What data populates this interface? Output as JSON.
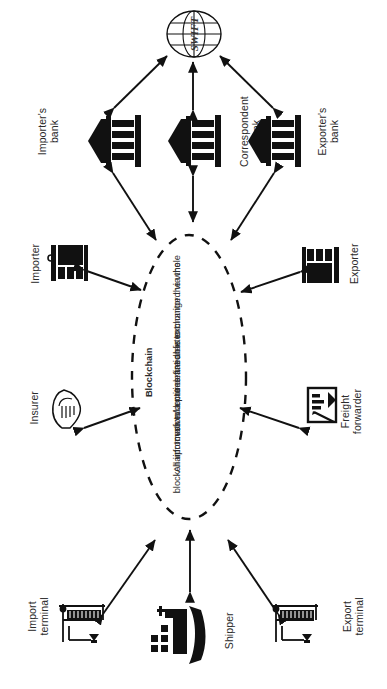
{
  "diagram": {
    "orientation": "rotated-90",
    "colors": {
      "ink": "#111111",
      "text": "#2b2b2b",
      "background": "#ffffff"
    }
  },
  "network": {
    "label": "SWIFT",
    "icon": "globe-icon"
  },
  "banks": [
    {
      "id": "importers-bank",
      "label_line1": "Importer's",
      "label_line2": "bank",
      "icon": "bank-icon"
    },
    {
      "id": "correspondent-bank",
      "label_line1": "Correspondent",
      "label_line2": "bank",
      "icon": "bank-icon"
    },
    {
      "id": "exporters-bank",
      "label_line1": "Exporter's",
      "label_line2": "bank",
      "icon": "bank-icon"
    }
  ],
  "blockchain": {
    "title": "Blockchain",
    "description_line1": "All information/documentation is exchanged via the",
    "description_line2": "blockchain. Involved entities are able to monitor the whole",
    "description_line3": "process to a pre-defined extent."
  },
  "entities": [
    {
      "id": "importer",
      "label_line1": "Importer",
      "label_line2": "",
      "icon": "factory-icon",
      "side": "left"
    },
    {
      "id": "insurer",
      "label_line1": "Insurer",
      "label_line2": "",
      "icon": "handshake-icon",
      "side": "left"
    },
    {
      "id": "exporter",
      "label_line1": "Exporter",
      "label_line2": "",
      "icon": "factory-icon",
      "side": "right"
    },
    {
      "id": "freight-forwarder",
      "label_line1": "Freight",
      "label_line2": "forwarder",
      "icon": "clipboard-chart-icon",
      "side": "right"
    },
    {
      "id": "import-terminal",
      "label_line1": "Import",
      "label_line2": "terminal",
      "icon": "port-crane-icon",
      "side": "bottom"
    },
    {
      "id": "shipper",
      "label_line1": "Shipper",
      "label_line2": "",
      "icon": "ship-icon",
      "side": "bottom"
    },
    {
      "id": "export-terminal",
      "label_line1": "Export",
      "label_line2": "terminal",
      "icon": "port-crane-icon",
      "side": "bottom"
    }
  ],
  "connections": [
    {
      "from": "importers-bank",
      "to": "swift",
      "type": "double-arrow"
    },
    {
      "from": "correspondent-bank",
      "to": "swift",
      "type": "double-arrow"
    },
    {
      "from": "exporters-bank",
      "to": "swift",
      "type": "double-arrow"
    },
    {
      "from": "importers-bank",
      "to": "blockchain",
      "type": "double-arrow"
    },
    {
      "from": "correspondent-bank",
      "to": "blockchain",
      "type": "double-arrow"
    },
    {
      "from": "exporters-bank",
      "to": "blockchain",
      "type": "double-arrow"
    },
    {
      "from": "importer",
      "to": "blockchain",
      "type": "double-arrow"
    },
    {
      "from": "insurer",
      "to": "blockchain",
      "type": "double-arrow"
    },
    {
      "from": "exporter",
      "to": "blockchain",
      "type": "double-arrow"
    },
    {
      "from": "freight-forwarder",
      "to": "blockchain",
      "type": "double-arrow"
    },
    {
      "from": "import-terminal",
      "to": "blockchain",
      "type": "double-arrow"
    },
    {
      "from": "shipper",
      "to": "blockchain",
      "type": "double-arrow"
    },
    {
      "from": "export-terminal",
      "to": "blockchain",
      "type": "double-arrow"
    }
  ]
}
